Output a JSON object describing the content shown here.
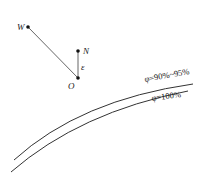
{
  "diagram": {
    "points": {
      "W": {
        "label": "W"
      },
      "N": {
        "label": "N"
      },
      "O": {
        "label": "O"
      }
    },
    "angle_label": "ε",
    "curves": [
      {
        "label": "φ=90%~95%"
      },
      {
        "label": "φ=100%"
      }
    ],
    "colors": {
      "line": "#333333",
      "background": "#ffffff"
    }
  }
}
